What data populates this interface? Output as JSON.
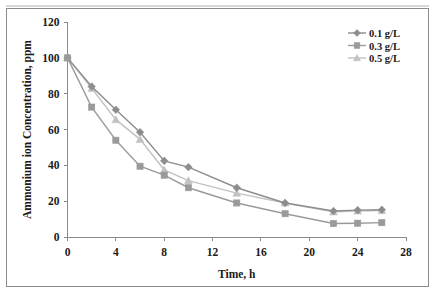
{
  "chart_data": {
    "type": "line",
    "title": "",
    "xlabel": "Time, h",
    "ylabel": "Ammonium ion Concentration, ppm",
    "x": [
      0,
      2,
      4,
      6,
      8,
      10,
      14,
      18,
      22,
      24,
      26
    ],
    "xlim": [
      0,
      28
    ],
    "ylim": [
      0,
      120
    ],
    "xticks": [
      "0",
      "4",
      "8",
      "12",
      "16",
      "20",
      "24",
      "28"
    ],
    "xtick_values": [
      0,
      4,
      8,
      12,
      16,
      20,
      24,
      28
    ],
    "yticks": [
      "0",
      "20",
      "40",
      "60",
      "80",
      "100",
      "120"
    ],
    "ytick_values": [
      0,
      20,
      40,
      60,
      80,
      100,
      120
    ],
    "grid": false,
    "legend_position": "top-right",
    "series": [
      {
        "name": "0.1 g/L",
        "marker": "diamond",
        "color": "#8d8d8d",
        "values": [
          100,
          84,
          71,
          58.5,
          42.5,
          39,
          27.5,
          19,
          14.5,
          15,
          15.2
        ]
      },
      {
        "name": "0.3 g/L",
        "marker": "square",
        "color": "#9a9a9a",
        "values": [
          100,
          72.5,
          54,
          39.5,
          34.5,
          27.5,
          19,
          13,
          7.5,
          7.7,
          8
        ]
      },
      {
        "name": "0.5 g/L",
        "marker": "triangle",
        "color": "#c2c2c2",
        "values": [
          100,
          83,
          65.5,
          54.5,
          37.5,
          31.5,
          24.5,
          19,
          14,
          14.5,
          14.8
        ]
      }
    ]
  },
  "legend": {
    "items": [
      {
        "label": "0.1 g/L"
      },
      {
        "label": "0.3 g/L"
      },
      {
        "label": "0.5 g/L"
      }
    ]
  },
  "axes": {
    "x_title": "Time, h",
    "y_title": "Ammonium ion Concentration, ppm"
  },
  "colors": {
    "series_1": "#8d8d8d",
    "series_2": "#9a9a9a",
    "series_3": "#c2c2c2",
    "axis": "#8a8a8a",
    "text": "#1a1a1a",
    "frame": "#8d8d8d",
    "background": "#ffffff"
  }
}
